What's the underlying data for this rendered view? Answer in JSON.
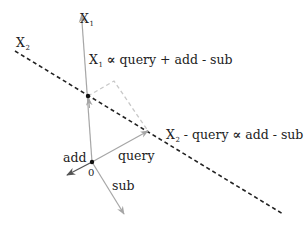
{
  "diagram": {
    "axes": {
      "x1": {
        "base": "X",
        "subscript": "1"
      },
      "x2": {
        "base": "X",
        "subscript": "2"
      }
    },
    "origin_label": "0",
    "vectors": {
      "add": "add",
      "query": "query",
      "sub": "sub"
    },
    "equations": {
      "x1_eq": {
        "lhs_base": "X",
        "lhs_sub": "1",
        "relation": "∝",
        "rhs": "query + add - sub"
      },
      "x2_eq": {
        "lhs_base": "X",
        "lhs_sub": "2",
        "lhs_rest": " - query",
        "relation": "∝",
        "rhs": "add - sub"
      }
    },
    "colors": {
      "vector_gray": "#a6a6a6",
      "dashed_line": "#222222",
      "projection_dash": "#c8c8c8",
      "add_vector": "#555555",
      "point": "#111111"
    }
  }
}
